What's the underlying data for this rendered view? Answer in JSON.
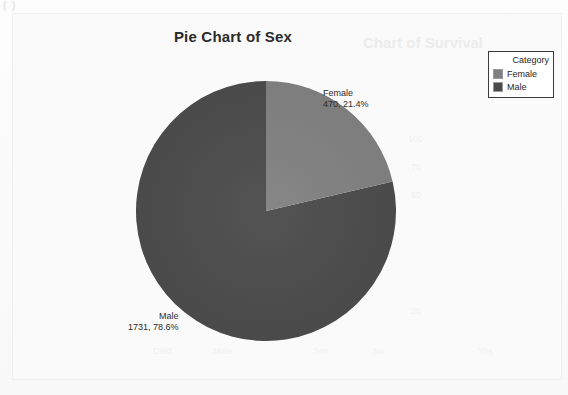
{
  "artifact": {
    "corner_marks": "( )"
  },
  "chart": {
    "title": "Pie Chart of Sex",
    "ghost_title": "Chart of Survival"
  },
  "legend": {
    "title": "Category",
    "items": [
      {
        "label": "Female",
        "color": "#808080"
      },
      {
        "label": "Male",
        "color": "#4a4a4a"
      }
    ]
  },
  "labels": {
    "female": {
      "name": "Female",
      "value": "470, 21.4%"
    },
    "male": {
      "name": "Male",
      "value": "1731, 78.6%"
    }
  },
  "chart_data": {
    "type": "pie",
    "title": "Pie Chart of Sex",
    "legend_title": "Category",
    "legend_position": "top-right",
    "categories": [
      "Female",
      "Male"
    ],
    "values": [
      470,
      1731
    ],
    "percents": [
      21.4,
      78.6
    ],
    "total": 2201,
    "colors": [
      "#808080",
      "#4a4a4a"
    ],
    "start_angle_deg": 0,
    "direction": "clockwise",
    "data_labels": [
      "Female\n470, 21.4%",
      "Male\n1731, 78.6%"
    ],
    "xlabel": "",
    "ylabel": ""
  }
}
